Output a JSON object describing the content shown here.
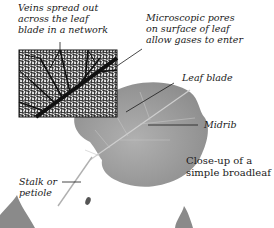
{
  "labels": {
    "veins": [
      "Veins spread out",
      "across the leaf",
      "blade in a network"
    ],
    "pores": [
      "Microscopic pores",
      "on surface of leaf",
      "allow gases to enter"
    ],
    "leaf_blade": "Leaf blade",
    "midrib": "Midrib",
    "stalk": [
      "Stalk or",
      "petiole"
    ]
  },
  "caption": [
    "Close-up of a",
    "simple broadleaf"
  ],
  "colors": {
    "leaf": "#8f8f8f",
    "leaf_light": "#b5b5b5",
    "vein_network": "#111111",
    "inset_bg": "#e8e8e8",
    "text": "#1a1a1a"
  }
}
